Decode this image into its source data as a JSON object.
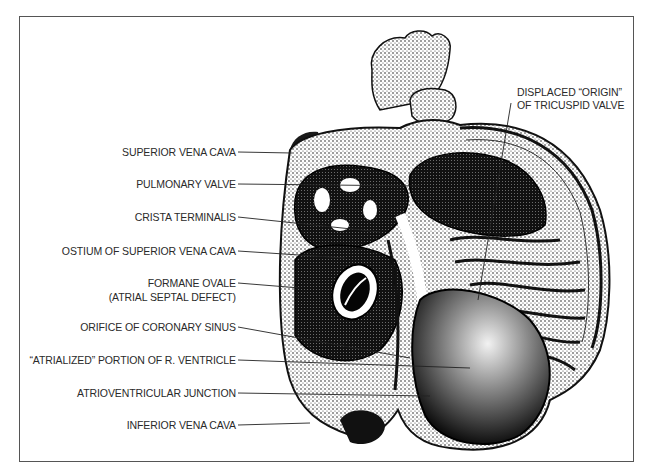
{
  "figure": {
    "colors": {
      "ink": "#111111",
      "text": "#2a2a2a",
      "frame": "#555555",
      "background": "#ffffff"
    }
  },
  "labels": {
    "left": [
      {
        "text": "SUPERIOR VENA CAVA"
      },
      {
        "text": "PULMONARY VALVE"
      },
      {
        "text": "CRISTA TERMINALIS"
      },
      {
        "text": "OSTIUM OF SUPERIOR VENA CAVA"
      },
      {
        "text": "FORMANE OVALE",
        "text2": "(ATRIAL SEPTAL DEFECT)"
      },
      {
        "text": "ORIFICE OF CORONARY SINUS"
      },
      {
        "text": "“ATRIALIZED” PORTION OF R. VENTRICLE"
      },
      {
        "text": "ATRIOVENTRICULAR JUNCTION"
      },
      {
        "text": "INFERIOR VENA CAVA"
      }
    ],
    "right": [
      {
        "text": "DISPLACED “ORIGIN”",
        "text2": "OF TRICUSPID VALVE"
      }
    ]
  }
}
